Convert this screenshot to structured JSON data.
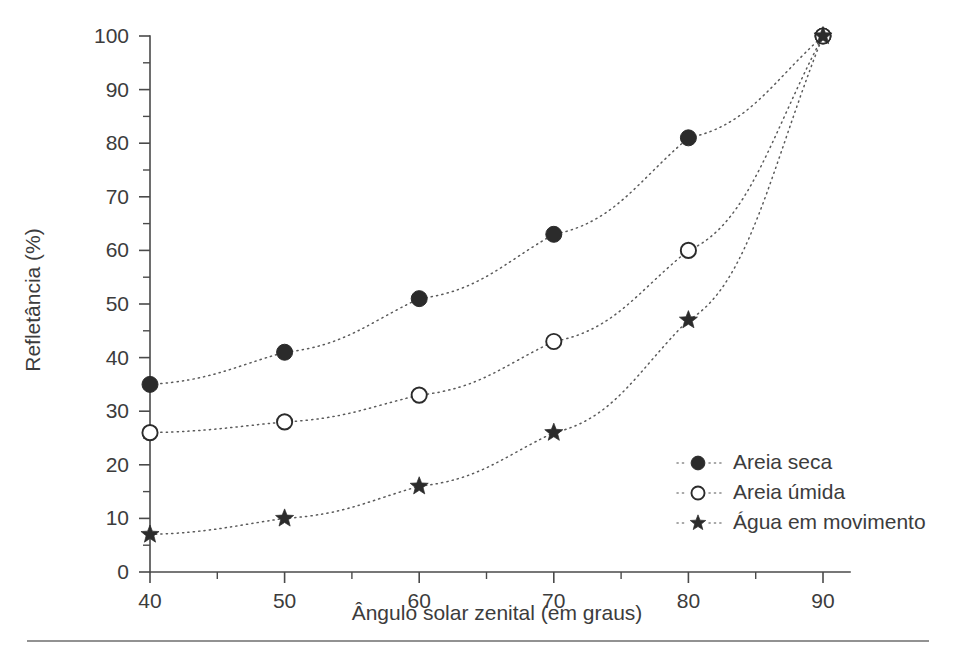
{
  "chart_data": {
    "type": "line",
    "title": "",
    "xlabel": "Ângulo solar zenital (em graus)",
    "ylabel": "Refletância (%)",
    "x": [
      40,
      50,
      60,
      70,
      80,
      90
    ],
    "xlim": [
      36,
      93
    ],
    "ylim": [
      0,
      100
    ],
    "xticks": [
      40,
      50,
      60,
      70,
      80,
      90
    ],
    "xtick_labels": [
      "40",
      "50",
      "60",
      "70",
      "80",
      "90"
    ],
    "xminor_ticks": [
      45,
      55,
      65,
      75,
      85
    ],
    "yticks": [
      0,
      10,
      20,
      30,
      40,
      50,
      60,
      70,
      80,
      90,
      100
    ],
    "ytick_labels": [
      "0",
      "10",
      "20",
      "30",
      "40",
      "50",
      "60",
      "70",
      "80",
      "90",
      "100"
    ],
    "yminor_ticks": [
      5,
      15,
      25,
      35,
      45,
      55,
      65,
      75,
      85,
      95
    ],
    "grid": false,
    "legend_position": "lower-right",
    "series": [
      {
        "name": "Areia seca",
        "marker": "filled-circle",
        "linestyle": "dotted",
        "values": [
          35,
          41,
          51,
          63,
          81,
          100
        ]
      },
      {
        "name": "Areia úmida",
        "marker": "open-circle",
        "linestyle": "dotted",
        "values": [
          26,
          28,
          33,
          43,
          60,
          100
        ]
      },
      {
        "name": "Água em movimento",
        "marker": "star",
        "linestyle": "dotted",
        "values": [
          7,
          10,
          16,
          26,
          47,
          100
        ]
      }
    ]
  },
  "legend": {
    "entries": [
      {
        "label": "Areia seca",
        "marker": "filled-circle-icon"
      },
      {
        "label": "Areia úmida",
        "marker": "open-circle-icon"
      },
      {
        "label": "Água em movimento",
        "marker": "star-icon"
      }
    ]
  },
  "colors": {
    "background": "#ffffff",
    "axis": "#4a4a4a",
    "marker": "#2b2b2b",
    "line": "#5a5a5a",
    "text": "#3c3c3c",
    "rule": "#6e6e6e"
  }
}
